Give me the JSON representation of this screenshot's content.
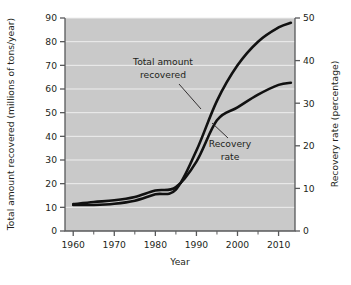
{
  "chart_data": {
    "type": "line",
    "title": "",
    "xlabel": "Year",
    "ylabel": "Total amount recovered (millions of tons/year)",
    "y2label": "Recovery rate (percentage)",
    "xlim": [
      1958,
      2014
    ],
    "ylim": [
      0,
      90
    ],
    "y2lim": [
      0,
      50
    ],
    "grid": true,
    "legend_position": "inline-annotations",
    "x_ticks_major": [
      1960,
      1970,
      1980,
      1990,
      2000,
      2010
    ],
    "x_ticks_major_labels": [
      "1960",
      "1970",
      "1980",
      "1990",
      "2000",
      "2010"
    ],
    "x_ticks_minor": [
      1965,
      1975,
      1985,
      1995,
      2005
    ],
    "y_ticks": [
      0,
      10,
      20,
      30,
      40,
      50,
      60,
      70,
      80,
      90
    ],
    "y_tick_labels": [
      "0",
      "10",
      "20",
      "30",
      "40",
      "50",
      "60",
      "70",
      "80",
      "90"
    ],
    "y2_ticks": [
      0,
      10,
      20,
      30,
      40,
      50
    ],
    "y2_tick_labels": [
      "0",
      "10",
      "20",
      "30",
      "40",
      "50"
    ],
    "series": [
      {
        "name": "Total amount recovered",
        "axis": "left",
        "units": "millions of tons/year",
        "x": [
          1960,
          1965,
          1970,
          1975,
          1980,
          1985,
          1990,
          1995,
          2000,
          2005,
          2010,
          2013
        ],
        "values": [
          11.0,
          11.0,
          11.5,
          12.8,
          15.5,
          17.5,
          34.0,
          55.0,
          70.0,
          80.0,
          86.0,
          88.0
        ]
      },
      {
        "name": "Recovery rate",
        "axis": "right",
        "units": "percentage",
        "x": [
          1960,
          1965,
          1970,
          1975,
          1980,
          1985,
          1990,
          1995,
          2000,
          2005,
          2010,
          2013
        ],
        "values": [
          6.3,
          6.8,
          7.2,
          8.0,
          9.5,
          10.3,
          16.3,
          26.0,
          29.0,
          32.0,
          34.3,
          34.8
        ]
      }
    ],
    "annotations": [
      {
        "text_line1": "Total amount",
        "text_line2": "recovered",
        "target_series": "Total amount recovered"
      },
      {
        "text_line1": "Recovery",
        "text_line2": "rate",
        "target_series": "Recovery rate"
      }
    ],
    "colors": {
      "plot_background": "#c9c9c9",
      "gridline": "#eeeeee",
      "line": "#111111",
      "axis": "#58595b",
      "text": "#231f20",
      "page_background": "#ffffff"
    }
  }
}
